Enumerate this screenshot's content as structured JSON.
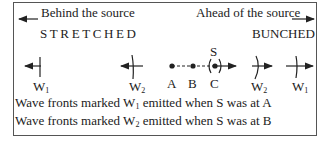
{
  "header": {
    "behind_label": "Behind the source",
    "ahead_label": "Ahead of the source",
    "behind_state": "STRETCHED",
    "ahead_state": "BUNCHED"
  },
  "wavefronts": {
    "left": [
      {
        "label": "W",
        "sub": "1"
      },
      {
        "label": "W",
        "sub": "2"
      }
    ],
    "right": [
      {
        "label": "W",
        "sub": "2"
      },
      {
        "label": "W",
        "sub": "1"
      }
    ]
  },
  "source": {
    "label": "S",
    "positions": [
      "A",
      "B",
      "C"
    ]
  },
  "notes": [
    {
      "prefix": "Wave fronts marked ",
      "w": "W",
      "sub": "1",
      "suffix": " emitted when S was at A"
    },
    {
      "prefix": "Wave fronts marked ",
      "w": "W",
      "sub": "2",
      "suffix": " emitted when S was at B"
    }
  ],
  "colors": {
    "ink": "#222222",
    "border": "#555555"
  }
}
